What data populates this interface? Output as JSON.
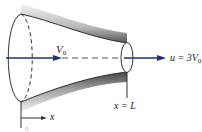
{
  "diagram": {
    "type": "converging nozzle",
    "labels": {
      "inlet_velocity": "V",
      "inlet_velocity_sub": "0",
      "outlet_velocity_prefix": "u = 3V",
      "outlet_velocity_sub": "0",
      "outlet_position": "x = L",
      "axis_label": "x",
      "origin_label": "0"
    },
    "colors": {
      "arrow": "#1f2f7a",
      "outline": "#333333",
      "wall_shade": "#9a9a9a",
      "equals_accent": "#3a8a5a"
    }
  }
}
